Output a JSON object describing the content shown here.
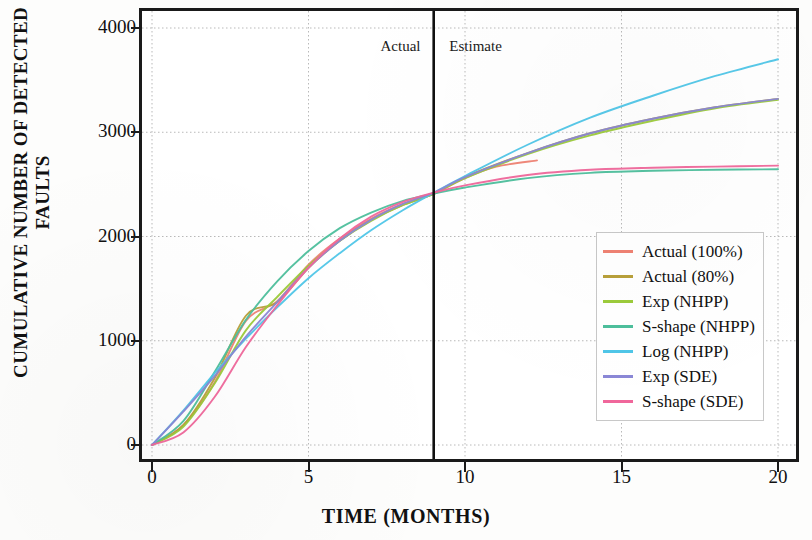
{
  "chart_data": {
    "type": "line",
    "title": "",
    "xlabel": "TIME (MONTHS)",
    "ylabel": "CUMULATIVE NUMBER OF DETECTED FAULTS",
    "xlim": [
      0,
      20
    ],
    "ylim": [
      0,
      4000
    ],
    "xticks": [
      "0",
      "5",
      "10",
      "15",
      "20"
    ],
    "xtick_values": [
      0,
      5,
      10,
      15,
      20
    ],
    "yticks": [
      "0",
      "1000",
      "2000",
      "3000",
      "4000"
    ],
    "ytick_values": [
      0,
      1000,
      2000,
      3000,
      4000
    ],
    "grid": true,
    "legend_position": "right-center",
    "annotations": [
      {
        "text": "Actual",
        "x": 7.3,
        "y": 3820
      },
      {
        "text": "Estimate",
        "x": 9.5,
        "y": 3820
      }
    ],
    "divider": {
      "x": 9,
      "label_left": "Actual",
      "label_right": "Estimate"
    },
    "series": [
      {
        "name": "Actual (100%)",
        "color": "#ef8273",
        "x": [
          0,
          1,
          2,
          3,
          4,
          5,
          6,
          7,
          8,
          9,
          10,
          11,
          12.3
        ],
        "values": [
          0,
          190,
          600,
          1190,
          1380,
          1730,
          1980,
          2170,
          2310,
          2410,
          2560,
          2670,
          2730
        ]
      },
      {
        "name": "Actual (80%)",
        "color": "#b8a03a",
        "x": [
          0,
          1,
          2,
          3,
          4,
          5,
          6,
          7,
          8,
          9,
          10,
          12,
          14,
          16,
          18,
          20
        ],
        "values": [
          0,
          190,
          640,
          1240,
          1370,
          1700,
          1960,
          2160,
          2300,
          2410,
          2570,
          2800,
          2990,
          3130,
          3240,
          3320
        ]
      },
      {
        "name": "Exp (NHPP)",
        "color": "#9ccb3b",
        "x": [
          0,
          1,
          2,
          3,
          4,
          5,
          6,
          7,
          8,
          9,
          10,
          12,
          14,
          16,
          18,
          20
        ],
        "values": [
          0,
          175,
          590,
          1100,
          1420,
          1720,
          1960,
          2150,
          2300,
          2410,
          2560,
          2790,
          2970,
          3110,
          3230,
          3310
        ]
      },
      {
        "name": "S-shape (NHPP)",
        "color": "#4dbf9c",
        "x": [
          0,
          1,
          2,
          3,
          4,
          5,
          6,
          7,
          8,
          9,
          10,
          12,
          14,
          16,
          18,
          20
        ],
        "values": [
          0,
          230,
          700,
          1200,
          1570,
          1860,
          2080,
          2230,
          2340,
          2410,
          2470,
          2560,
          2610,
          2630,
          2640,
          2645
        ]
      },
      {
        "name": "Log (NHPP)",
        "color": "#4fc6e8",
        "x": [
          0,
          1,
          2,
          3,
          4,
          5,
          6,
          7,
          8,
          9,
          10,
          12,
          14,
          16,
          18,
          20
        ],
        "values": [
          0,
          330,
          690,
          1020,
          1320,
          1600,
          1840,
          2060,
          2250,
          2420,
          2580,
          2880,
          3140,
          3350,
          3540,
          3700
        ]
      },
      {
        "name": "Exp (SDE)",
        "color": "#8a87d6",
        "x": [
          0,
          1,
          2,
          3,
          4,
          5,
          6,
          7,
          8,
          9,
          10,
          12,
          14,
          16,
          18,
          20
        ],
        "values": [
          0,
          320,
          660,
          1040,
          1370,
          1700,
          1960,
          2160,
          2310,
          2420,
          2570,
          2800,
          2990,
          3130,
          3240,
          3320
        ]
      },
      {
        "name": "S-shape (SDE)",
        "color": "#f0679b",
        "x": [
          0,
          1,
          2,
          3,
          4,
          5,
          6,
          7,
          8,
          9,
          10,
          12,
          14,
          16,
          18,
          20
        ],
        "values": [
          0,
          120,
          460,
          940,
          1340,
          1700,
          1980,
          2190,
          2330,
          2420,
          2490,
          2590,
          2640,
          2660,
          2670,
          2680
        ]
      }
    ]
  },
  "legend": {
    "items": [
      {
        "label": "Actual (100%)",
        "color": "#ef8273"
      },
      {
        "label": "Actual (80%)",
        "color": "#b8a03a"
      },
      {
        "label": "Exp (NHPP)",
        "color": "#9ccb3b"
      },
      {
        "label": "S-shape (NHPP)",
        "color": "#4dbf9c"
      },
      {
        "label": "Log (NHPP)",
        "color": "#4fc6e8"
      },
      {
        "label": "Exp (SDE)",
        "color": "#8a87d6"
      },
      {
        "label": "S-shape (SDE)",
        "color": "#f0679b"
      }
    ]
  },
  "colors": {
    "axis": "#1a1a1a",
    "grid": "#b9b9b9",
    "background": "#ffffff",
    "divider": "#101010"
  }
}
